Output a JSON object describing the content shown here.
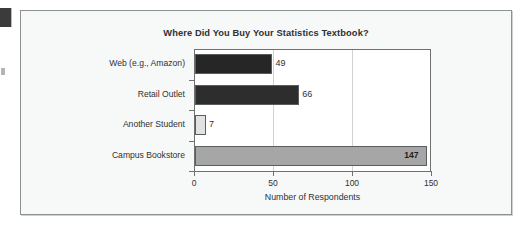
{
  "figure": {
    "background": "#f7f8f8",
    "frame_color": "#8e9192"
  },
  "chart_data": {
    "type": "bar",
    "orientation": "horizontal",
    "title": "Where Did You Buy Your Statistics Textbook?",
    "xlabel": "Number of Respondents",
    "ylabel": "",
    "categories": [
      "Web (e.g., Amazon)",
      "Retail Outlet",
      "Another Student",
      "Campus Bookstore"
    ],
    "values": [
      49,
      66,
      7,
      147
    ],
    "value_labels": [
      "49",
      "66",
      "7",
      "147"
    ],
    "bar_colors": [
      "#262626",
      "#2d2d2d",
      "#e2e2e2",
      "#a6a6a6"
    ],
    "label_inside": [
      false,
      false,
      false,
      true
    ],
    "xlim": [
      0,
      150
    ],
    "xticks": [
      0,
      50,
      100,
      150
    ],
    "xticklabels": [
      "0",
      "50",
      "100",
      "150"
    ],
    "gridlines": [
      50,
      100
    ],
    "grid": true,
    "legend": null
  },
  "artifacts": {
    "margin_mark_top": "page-edge-mark",
    "margin_mark_mid": "page-edge-speck"
  }
}
